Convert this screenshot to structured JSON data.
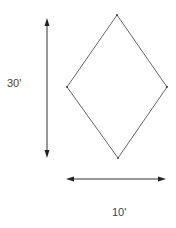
{
  "diagram": {
    "shape": "rhombus",
    "labels": {
      "height": "30'",
      "width": "10'"
    },
    "colors": {
      "stroke": "#444444",
      "text": "#444444"
    }
  }
}
